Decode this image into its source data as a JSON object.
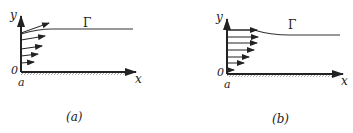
{
  "figures": [
    {
      "id": "a",
      "caption": "(a)",
      "axis_x_label": "x",
      "axis_y_label": "y",
      "origin_label": "0",
      "point_label": "a",
      "boundary_label": "Γ",
      "description": "Velocity profile with outflow arrows; boundary Γ rises then flat"
    },
    {
      "id": "b",
      "caption": "(b)",
      "axis_x_label": "x",
      "axis_y_label": "y",
      "origin_label": "0",
      "point_label": "a",
      "boundary_label": "Γ",
      "description": "Uniform-ish velocity profile; boundary Γ flat then descending slightly"
    }
  ]
}
